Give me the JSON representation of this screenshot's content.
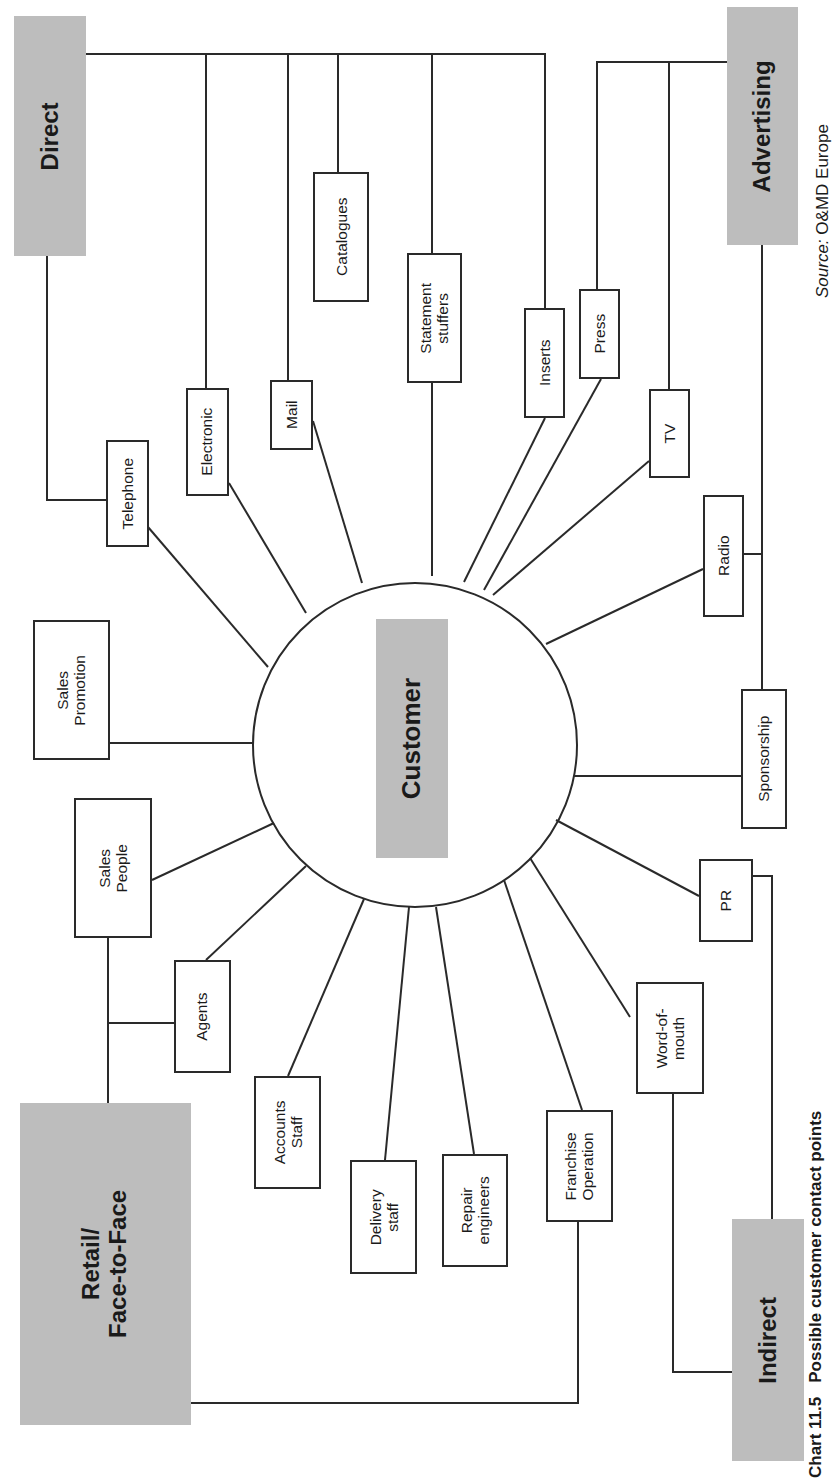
{
  "diagram": {
    "center": {
      "label": "Customer"
    },
    "categories": {
      "direct": "Direct",
      "advertising": "Advertising",
      "retail": {
        "line1": "Retail/",
        "line2": "Face-to-Face"
      },
      "indirect": "Indirect"
    },
    "contacts": {
      "telephone": "Telephone",
      "electronic": "Electronic",
      "mail": "Mail",
      "catalogues": "Catalogues",
      "statement_stuffers": {
        "line1": "Statement",
        "line2": "stuffers"
      },
      "inserts": "Inserts",
      "press": "Press",
      "tv": "TV",
      "radio": "Radio",
      "sponsorship": "Sponsorship",
      "pr": "PR",
      "word_of_mouth": {
        "line1": "Word-of-",
        "line2": "mouth"
      },
      "franchise_operation": {
        "line1": "Franchise",
        "line2": "Operation"
      },
      "repair_engineers": {
        "line1": "Repair",
        "line2": "engineers"
      },
      "delivery_staff": {
        "line1": "Delivery",
        "line2": "staff"
      },
      "accounts_staff": {
        "line1": "Accounts",
        "line2": "Staff"
      },
      "agents": "Agents",
      "sales_people": {
        "line1": "Sales",
        "line2": "People"
      },
      "sales_promotion": {
        "line1": "Sales",
        "line2": "Promotion"
      }
    },
    "groupings": {
      "Direct": [
        "Telephone",
        "Electronic",
        "Mail",
        "Catalogues",
        "Statement stuffers",
        "Inserts"
      ],
      "Advertising": [
        "Press",
        "TV",
        "Radio",
        "Sponsorship"
      ],
      "Indirect": [
        "PR",
        "Word-of-mouth"
      ],
      "Retail/Face-to-Face": [
        "Sales People",
        "Agents",
        "Franchise Operation"
      ],
      "Ungrouped": [
        "Sales Promotion",
        "Accounts Staff",
        "Delivery staff",
        "Repair engineers"
      ]
    }
  },
  "caption": {
    "number": "Chart 11.5",
    "title": "Possible customer contact points"
  },
  "source": {
    "label": "Source:",
    "value": "O&MD Europe"
  },
  "colors": {
    "category_fill": "#bdbdbd",
    "line": "#2a2a2a",
    "background": "#ffffff"
  }
}
